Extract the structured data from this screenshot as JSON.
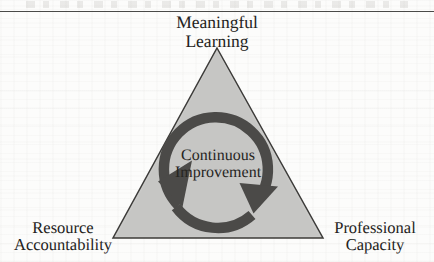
{
  "figure": {
    "type": "triangle-cycle-diagram",
    "background_color": "#fcfcfb",
    "page_rule_color": "#4a4a48"
  },
  "triangle": {
    "fill_color": "#c9c9c7",
    "stroke_color": "#3c3b39",
    "apex": {
      "x": 217,
      "y": 48
    },
    "bottom_left": {
      "x": 113,
      "y": 238
    },
    "bottom_right": {
      "x": 323,
      "y": 238
    }
  },
  "cycle": {
    "label_line1": "Continuous",
    "label_line2": "Improvement",
    "ring_color": "#4b4a48",
    "direction": "clockwise",
    "center": {
      "x": 218,
      "y": 170
    },
    "radius": 52,
    "thickness": 10,
    "arrowhead_count": 2
  },
  "vertices": [
    {
      "id": "meaningful-learning",
      "position": "apex",
      "line1": "Meaningful",
      "line2": "Learning"
    },
    {
      "id": "resource-accountability",
      "position": "bottom-left",
      "line1": "Resource",
      "line2": "Accountability"
    },
    {
      "id": "professional-capacity",
      "position": "bottom-right",
      "line1": "Professional",
      "line2": "Capacity"
    }
  ]
}
